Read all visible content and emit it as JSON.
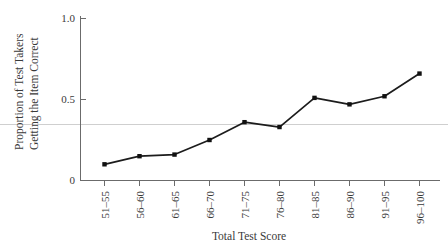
{
  "chart_data": {
    "type": "line",
    "title": "",
    "xlabel": "Total Test Score",
    "ylabel": "Proportion of Test Takers Getting the Item Correct",
    "ylabel_line1": "Proportion of Test Takers",
    "ylabel_line2": "Getting the Item Correct",
    "categories": [
      "51–55",
      "56–60",
      "61–65",
      "66–70",
      "71–75",
      "76–80",
      "81–85",
      "86–90",
      "91–95",
      "96–100"
    ],
    "values": [
      0.1,
      0.15,
      0.16,
      0.25,
      0.36,
      0.33,
      0.51,
      0.47,
      0.52,
      0.66
    ],
    "ylim": [
      0,
      1.0
    ],
    "ytick_values": [
      0,
      0.5,
      1.0
    ],
    "ytick_labels": [
      "0",
      "0.5",
      "1.0"
    ],
    "grid": false,
    "legend": false,
    "legend_position": "none",
    "annotations": [
      {
        "name": "reference-line",
        "type": "horizontal-line",
        "value": 0.345,
        "color": "#cfcfcf"
      }
    ],
    "marker": "square",
    "line_color": "#1c1c1c",
    "marker_color": "#111111",
    "axis_color": "#6b6b6b",
    "background_color": "#ffffff"
  }
}
